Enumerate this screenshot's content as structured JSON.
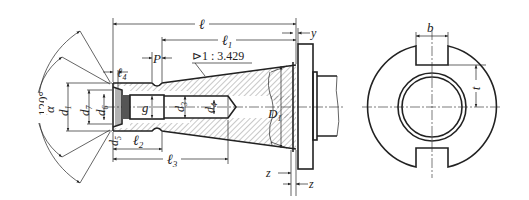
{
  "figure": {
    "type": "engineering-drawing",
    "colors": {
      "line": "#222222",
      "hatch": "#444444",
      "background": "#ffffff"
    }
  },
  "labels": {
    "angle_outer": "120°",
    "angle_inner": "α",
    "l": "ℓ",
    "l1": "ℓ",
    "l1_sub": "1",
    "l2": "ℓ",
    "l2_sub": "2",
    "l3": "ℓ",
    "l3_sub": "3",
    "l4": "ℓ",
    "l4_sub": "4",
    "p": "P",
    "taper": "⊳1 : 3.429",
    "y": "y",
    "z_left": "z",
    "z_right": "z",
    "d1": "d",
    "d1_sub": "1",
    "d7": "d",
    "d7_sub": "7",
    "d6": "d",
    "d6_sub": "6",
    "d5": "d",
    "d5_sub": "5",
    "d3": "d",
    "d3_sub": "3",
    "d4": "d",
    "d4_sub": "4",
    "g": "g",
    "D1": "D",
    "D1_sub": "1",
    "b": "b",
    "t": "t"
  }
}
